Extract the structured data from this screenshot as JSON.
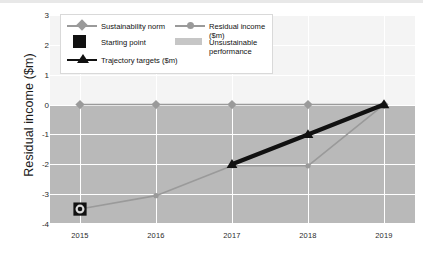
{
  "chart_data": {
    "type": "line",
    "title": "",
    "xlabel": "",
    "ylabel": "Residual income ($m)",
    "categories": [
      "2015",
      "2016",
      "2017",
      "2018",
      "2019"
    ],
    "ylim": [
      -4,
      3
    ],
    "yticks": [
      "3",
      "2",
      "1",
      "0",
      "-1",
      "-2",
      "-3",
      "-4"
    ],
    "ytick_values": [
      3,
      2,
      1,
      0,
      -1,
      -2,
      -3,
      -4
    ],
    "grid": true,
    "legend_position": "top-left inside plot",
    "series": [
      {
        "name": "Sustainability norm",
        "marker": "diamond",
        "color": "#9a9a9a",
        "x": [
          "2015",
          "2016",
          "2017",
          "2018",
          "2019"
        ],
        "values": [
          0,
          0,
          0,
          0,
          0
        ]
      },
      {
        "name": "Residual income ($m)",
        "marker": "circle",
        "color": "#9a9a9a",
        "x": [
          "2015",
          "2016",
          "2017",
          "2018",
          "2019"
        ],
        "values": [
          -3.5,
          -3.05,
          -2.05,
          -2.05,
          0
        ]
      },
      {
        "name": "Trajectory targets ($m)",
        "marker": "triangle",
        "color": "#111111",
        "x": [
          "2017",
          "2018",
          "2019"
        ],
        "values": [
          -2,
          -1,
          0
        ]
      },
      {
        "name": "Starting point",
        "marker": "square",
        "color": "#111111",
        "x": [
          "2015"
        ],
        "values": [
          -3.5
        ]
      }
    ],
    "bands": [
      {
        "name": "Unsustainable performance",
        "color": "#b9b9b9",
        "from": -4,
        "to": 0
      }
    ],
    "annotations": []
  },
  "legend": {
    "items": [
      {
        "label": "Sustainability norm",
        "key": "line-diamond-marker",
        "color": "#9a9a9a"
      },
      {
        "label": "Residual income ($m)",
        "key": "line-circle-marker",
        "color": "#9a9a9a"
      },
      {
        "label": "Starting point",
        "key": "filled-square-marker",
        "color": "#111111"
      },
      {
        "label": "Unsustainable\nperformance",
        "key": "shaded-band-swatch",
        "color": "#c6c6c6"
      },
      {
        "label": "Trajectory targets ($m)",
        "key": "line-triangle-marker",
        "color": "#111111"
      }
    ]
  },
  "axes": {
    "y_title": "Residual income ($m)",
    "y_ticks": [
      "3",
      "2",
      "1",
      "0",
      "-1",
      "-2",
      "-3",
      "-4"
    ],
    "x_ticks": [
      "2015",
      "2016",
      "2017",
      "2018",
      "2019"
    ]
  },
  "colors": {
    "band": "#b9b9b9",
    "plot_background": "#f4f4f4",
    "grey_series": "#9a9a9a",
    "black_series": "#111111",
    "gridline": "#ffffff"
  }
}
